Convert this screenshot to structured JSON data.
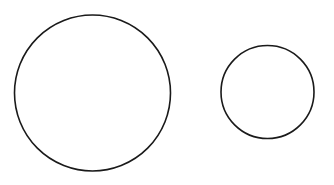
{
  "canvas": {
    "width": 334,
    "height": 185,
    "background": "#ffffff"
  },
  "stroke_color": "#1a1a1a",
  "shapes": [
    {
      "type": "circle",
      "name": "large-circle",
      "cx": 92.5,
      "cy": 93,
      "r": 78,
      "stroke_width": 1.6
    },
    {
      "type": "circle",
      "name": "small-circle",
      "cx": 267.5,
      "cy": 92,
      "r": 46.5,
      "stroke_width": 1.6
    }
  ]
}
